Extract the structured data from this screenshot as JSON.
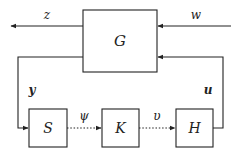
{
  "diagram": {
    "blocks": {
      "G": {
        "label": "G"
      },
      "S": {
        "label": "S"
      },
      "K": {
        "label": "K"
      },
      "H": {
        "label": "H"
      }
    },
    "signals": {
      "z": "z",
      "w": "w",
      "y": "y",
      "u": "u",
      "psi": "ψ",
      "upsilon": "υ"
    },
    "edges": [
      {
        "from": "G",
        "to": "out",
        "label": "z",
        "style": "solid"
      },
      {
        "from": "in",
        "to": "G",
        "label": "w",
        "style": "solid"
      },
      {
        "from": "G",
        "to": "S",
        "label": "y",
        "style": "solid"
      },
      {
        "from": "S",
        "to": "K",
        "label": "ψ",
        "style": "dotted"
      },
      {
        "from": "K",
        "to": "H",
        "label": "υ",
        "style": "dotted"
      },
      {
        "from": "H",
        "to": "G",
        "label": "u",
        "style": "solid"
      }
    ],
    "colors": {
      "line": "#222222",
      "background": "#ffffff"
    }
  }
}
